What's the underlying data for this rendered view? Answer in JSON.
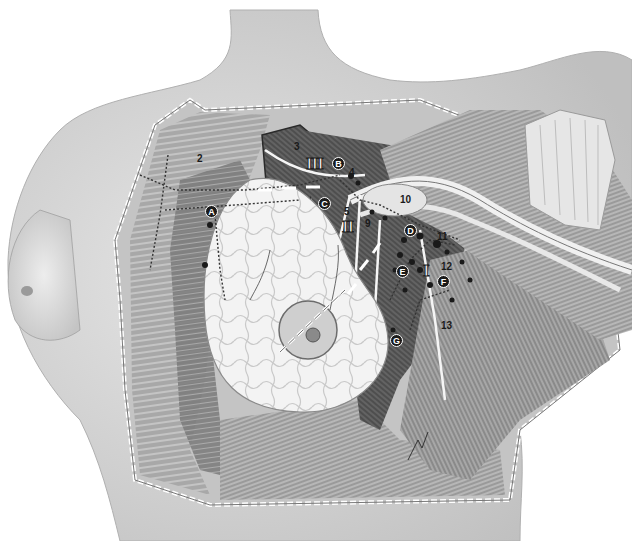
{
  "figure": {
    "style": "grayscale medical illustration",
    "colors": {
      "background": "#ffffff",
      "skin": "#dcdcdc",
      "skin_shadow": "#bdbdbd",
      "muscle_dark": "#5a5a5a",
      "muscle_mid": "#8c8c8c",
      "muscle_light": "#b8b8b8",
      "breast_tissue": "#f2f2f2",
      "label_text": "#1a1a1a"
    },
    "number_labels": [
      {
        "id": "2",
        "text": "2"
      },
      {
        "id": "3",
        "text": "3"
      },
      {
        "id": "4",
        "text": "4"
      },
      {
        "id": "5",
        "text": "5"
      },
      {
        "id": "9",
        "text": "9"
      },
      {
        "id": "10",
        "text": "10"
      },
      {
        "id": "11",
        "text": "11"
      },
      {
        "id": "12",
        "text": "12"
      },
      {
        "id": "13",
        "text": "13"
      }
    ],
    "letter_labels": [
      {
        "id": "A",
        "text": "A"
      },
      {
        "id": "B",
        "text": "B"
      },
      {
        "id": "C",
        "text": "C"
      },
      {
        "id": "D",
        "text": "D"
      },
      {
        "id": "E",
        "text": "E"
      },
      {
        "id": "F",
        "text": "F"
      },
      {
        "id": "G",
        "text": "G"
      }
    ],
    "level_labels": [
      {
        "id": "I",
        "text": "I"
      },
      {
        "id": "II",
        "text": "II"
      },
      {
        "id": "III",
        "text": "III"
      }
    ]
  }
}
